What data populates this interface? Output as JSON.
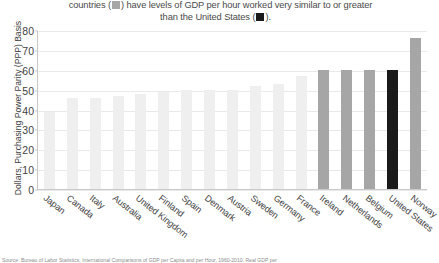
{
  "caption": {
    "line1_before": "countries (",
    "line1_after": ") have levels of GDP per hour worked very similar to or greater",
    "line2_before": "than the United States (",
    "line2_after": ")."
  },
  "source": {
    "text": "Source: Bureau of Labor Statistics, International Comparisons of GDP per Capita and per Hour, 1960-2010. Real GDP per"
  },
  "colors": {
    "bar_light": "#efefef",
    "bar_gray": "#a6a6a6",
    "bar_black": "#1a1a1a",
    "gridline": "#e9e9e9",
    "axis": "#c9c9c9",
    "text": "#3f3f3f"
  },
  "chart_data": {
    "type": "bar",
    "title": "",
    "xlabel": "",
    "ylabel": "Dollars, Purchasing Power Parity (PPP) Basis",
    "ylim": [
      0,
      80
    ],
    "yticks": [
      0,
      10,
      20,
      30,
      40,
      50,
      60,
      70,
      80
    ],
    "grid": true,
    "legend": "none",
    "categories": [
      "Japan",
      "Canada",
      "Italy",
      "Australia",
      "United Kingdom",
      "Finland",
      "Spain",
      "Denmark",
      "Austria",
      "Sweden",
      "Germany",
      "France",
      "Ireland",
      "Netherlands",
      "Belgium",
      "United States",
      "Norway"
    ],
    "values": [
      39,
      46,
      46,
      47,
      48,
      49,
      50,
      50,
      50,
      52,
      53,
      57,
      60,
      60,
      60,
      60,
      76
    ],
    "bar_colors": [
      "#efefef",
      "#efefef",
      "#efefef",
      "#efefef",
      "#efefef",
      "#efefef",
      "#efefef",
      "#efefef",
      "#efefef",
      "#efefef",
      "#efefef",
      "#efefef",
      "#a6a6a6",
      "#a6a6a6",
      "#a6a6a6",
      "#1a1a1a",
      "#a6a6a6"
    ]
  }
}
